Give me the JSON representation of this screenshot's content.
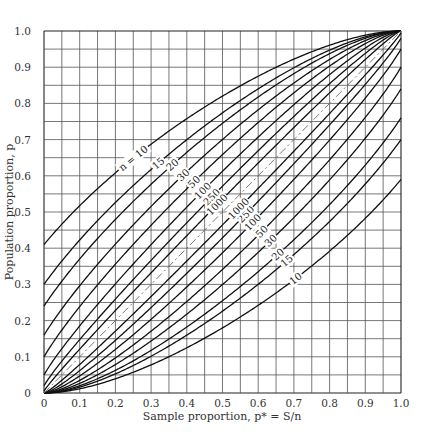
{
  "chart_data": {
    "type": "line",
    "title": "",
    "xlabel": "Sample proportion, p* = S/n",
    "ylabel": "Population proportion, p",
    "xlim": [
      0,
      1.0
    ],
    "ylim": [
      0,
      1.0
    ],
    "grid": true,
    "grid_step": 0.05,
    "x_ticks": [
      "0",
      "0.1",
      "0.2",
      "0.3",
      "0.4",
      "0.5",
      "0.6",
      "0.7",
      "0.8",
      "0.9",
      "1.0"
    ],
    "y_ticks": [
      "0",
      "0.1",
      "0.2",
      "0.3",
      "0.4",
      "0.5",
      "0.6",
      "0.7",
      "0.8",
      "0.9",
      "1.0"
    ],
    "confidence_level_z": 2.576,
    "series": [
      {
        "name": "n = 10",
        "n": 10,
        "upper_at_0": 0.41,
        "lower_at_1": 0.59,
        "label_upper": "n = 10",
        "label_lower": "10"
      },
      {
        "name": "n = 15",
        "n": 15,
        "upper_at_0": 0.3,
        "lower_at_1": 0.7,
        "label_upper": "15",
        "label_lower": "15"
      },
      {
        "name": "n = 20",
        "n": 20,
        "upper_at_0": 0.24,
        "lower_at_1": 0.76,
        "label_upper": "20",
        "label_lower": "20"
      },
      {
        "name": "n = 30",
        "n": 30,
        "upper_at_0": 0.16,
        "lower_at_1": 0.84,
        "label_upper": "30",
        "label_lower": "30"
      },
      {
        "name": "n = 50",
        "n": 50,
        "upper_at_0": 0.1,
        "lower_at_1": 0.9,
        "label_upper": "50",
        "label_lower": "50"
      },
      {
        "name": "n = 100",
        "n": 100,
        "upper_at_0": 0.05,
        "lower_at_1": 0.95,
        "label_upper": "100",
        "label_lower": "100"
      },
      {
        "name": "n = 250",
        "n": 250,
        "upper_at_0": 0.02,
        "lower_at_1": 0.98,
        "label_upper": "250",
        "label_lower": "250"
      },
      {
        "name": "n = 1000",
        "n": 1000,
        "upper_at_0": 0.005,
        "lower_at_1": 0.995,
        "label_upper": "1000",
        "label_lower": "1000"
      }
    ],
    "reference_line": {
      "name": "p = p*",
      "style": "dash-dot",
      "x": [
        0,
        1
      ],
      "y": [
        0,
        1
      ]
    },
    "annotations": {
      "upper_label_positions_pstar": [
        0.25,
        0.32,
        0.36,
        0.39,
        0.42,
        0.445,
        0.47,
        0.485
      ],
      "lower_label_positions_pstar": [
        0.705,
        0.68,
        0.655,
        0.635,
        0.61,
        0.585,
        0.565,
        0.545
      ]
    }
  }
}
